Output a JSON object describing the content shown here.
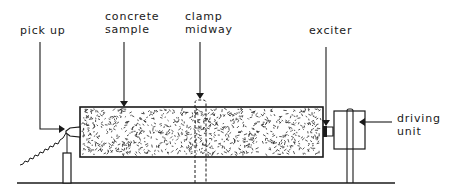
{
  "diagram": {
    "type": "apparatus-schematic",
    "labels": {
      "pick_up": "pick up",
      "concrete_sample_line1": "concrete",
      "concrete_sample_line2": "sample",
      "clamp_midway_line1": "clamp",
      "clamp_midway_line2": "midway",
      "exciter": "exciter",
      "driving_unit_line1": "driving",
      "driving_unit_line2": "unit"
    },
    "components": [
      {
        "id": "pick-up",
        "description": "transducer with output signal"
      },
      {
        "id": "concrete-sample",
        "description": "speckled concrete prism"
      },
      {
        "id": "clamp",
        "description": "dashed clamp at midspan"
      },
      {
        "id": "exciter",
        "description": "exciter on sample end"
      },
      {
        "id": "driving-unit",
        "description": "box on post"
      }
    ],
    "colors": {
      "ink": "#1a1a1a",
      "background": "#ffffff"
    }
  }
}
